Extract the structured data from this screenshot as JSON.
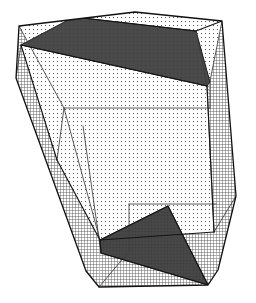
{
  "figure": {
    "title": "3D polyhedron wireframe with shaded faces",
    "type": "line-drawing",
    "width": 256,
    "height": 303,
    "background_color": "#ffffff",
    "line_color": "#1a1a1a",
    "fill_light_color": "#f2f2f2",
    "fill_medium_color": "#d8d8d8",
    "fill_dark_color": "#4a4a4a",
    "fill_darker_color": "#3a3a3a",
    "stipple_dot_color": "#555555",
    "hatch_line_color": "#666666",
    "stroke_width": 1.1
  },
  "geometry": {
    "silhouette_outline": [
      [
        19,
        26
      ],
      [
        135,
        12
      ],
      [
        222,
        21
      ],
      [
        236,
        196
      ],
      [
        218,
        270
      ],
      [
        208,
        285
      ],
      [
        99,
        287
      ],
      [
        86,
        271
      ],
      [
        16,
        78
      ]
    ],
    "faces": [
      {
        "name": "top-dark-facet",
        "shade": "dark",
        "points": [
          [
            21,
            45
          ],
          [
            74,
            17
          ],
          [
            196,
            31
          ],
          [
            210,
            81
          ],
          [
            207,
            86
          ]
        ]
      },
      {
        "name": "top-light-facet-left",
        "shade": "light",
        "points": [
          [
            19,
            26
          ],
          [
            135,
            12
          ],
          [
            196,
            31
          ],
          [
            74,
            17
          ]
        ]
      },
      {
        "name": "front-large-face",
        "shade": "light-stipple",
        "points": [
          [
            21,
            45
          ],
          [
            207,
            86
          ],
          [
            214,
            232
          ],
          [
            100,
            240
          ],
          [
            57,
            160
          ]
        ]
      },
      {
        "name": "left-side-face",
        "shade": "cross-hatch",
        "points": [
          [
            16,
            78
          ],
          [
            57,
            160
          ],
          [
            100,
            240
          ],
          [
            99,
            287
          ],
          [
            86,
            271
          ]
        ]
      },
      {
        "name": "right-side-face",
        "shade": "cross-hatch",
        "points": [
          [
            207,
            86
          ],
          [
            222,
            21
          ],
          [
            236,
            196
          ],
          [
            218,
            270
          ],
          [
            214,
            232
          ]
        ]
      },
      {
        "name": "bottom-dark-facet",
        "shade": "dark",
        "points": [
          [
            100,
            240
          ],
          [
            168,
            206
          ],
          [
            208,
            285
          ],
          [
            102,
            254
          ]
        ]
      },
      {
        "name": "bottom-light-facet",
        "shade": "cross-hatch",
        "points": [
          [
            100,
            240
          ],
          [
            214,
            232
          ],
          [
            208,
            285
          ],
          [
            99,
            287
          ]
        ]
      }
    ],
    "hidden_edges": [
      [
        [
          19,
          26
        ],
        [
          64,
          108
        ]
      ],
      [
        [
          64,
          108
        ],
        [
          57,
          160
        ]
      ],
      [
        [
          64,
          108
        ],
        [
          207,
          108
        ]
      ],
      [
        [
          207,
          108
        ],
        [
          210,
          81
        ]
      ],
      [
        [
          83,
          126
        ],
        [
          100,
          240
        ]
      ],
      [
        [
          64,
          108
        ],
        [
          100,
          240
        ]
      ],
      [
        [
          129,
          204
        ],
        [
          129,
          248
        ]
      ],
      [
        [
          129,
          204
        ],
        [
          214,
          204
        ]
      ],
      [
        [
          99,
          287
        ],
        [
          129,
          248
        ]
      ],
      [
        [
          214,
          232
        ],
        [
          236,
          196
        ]
      ],
      [
        [
          207,
          86
        ],
        [
          196,
          31
        ]
      ],
      [
        [
          222,
          21
        ],
        [
          210,
          81
        ]
      ],
      [
        [
          208,
          285
        ],
        [
          218,
          270
        ]
      ]
    ],
    "vertex_count": 9,
    "edge_count": 22
  },
  "patterns": {
    "stipple_spacing_px": 4,
    "stipple_dot_size_px": 1,
    "hatch_spacing_px": 3,
    "hatch_angle_deg": 0
  },
  "labels": {
    "none_visible": ""
  }
}
